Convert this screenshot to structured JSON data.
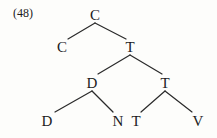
{
  "figure": {
    "example_number": "(48)",
    "kind": "syntactic-tree-diagram",
    "background_color": "#fdfdfb",
    "line_color": "#2a2a2a",
    "text_color": "#1b1b1b"
  },
  "tree": {
    "nodes": [
      {
        "id": "n0",
        "label": "C",
        "x": 95,
        "y": 8,
        "level": 0
      },
      {
        "id": "n1",
        "label": "C",
        "x": 62,
        "y": 40,
        "level": 1
      },
      {
        "id": "n2",
        "label": "T",
        "x": 130,
        "y": 40,
        "level": 1
      },
      {
        "id": "n3",
        "label": "D",
        "x": 92,
        "y": 76,
        "level": 2
      },
      {
        "id": "n4",
        "label": "T",
        "x": 165,
        "y": 76,
        "level": 2
      },
      {
        "id": "n5",
        "label": "D",
        "x": 47,
        "y": 114,
        "level": 3
      },
      {
        "id": "n6",
        "label": "N",
        "x": 118,
        "y": 114,
        "level": 3
      },
      {
        "id": "n7",
        "label": "T",
        "x": 136,
        "y": 114,
        "level": 3
      },
      {
        "id": "n8",
        "label": "V",
        "x": 198,
        "y": 114,
        "level": 3
      }
    ],
    "edges": [
      {
        "from": "n0",
        "to": "n1",
        "x1": 95,
        "y1": 23,
        "x2": 68,
        "y2": 39
      },
      {
        "from": "n0",
        "to": "n2",
        "x1": 95,
        "y1": 23,
        "x2": 126,
        "y2": 39
      },
      {
        "from": "n2",
        "to": "n3",
        "x1": 130,
        "y1": 55,
        "x2": 98,
        "y2": 74
      },
      {
        "from": "n2",
        "to": "n4",
        "x1": 130,
        "y1": 55,
        "x2": 162,
        "y2": 74
      },
      {
        "from": "n3",
        "to": "n5",
        "x1": 92,
        "y1": 91,
        "x2": 55,
        "y2": 112
      },
      {
        "from": "n3",
        "to": "n6",
        "x1": 92,
        "y1": 91,
        "x2": 113,
        "y2": 112
      },
      {
        "from": "n4",
        "to": "n7",
        "x1": 165,
        "y1": 91,
        "x2": 141,
        "y2": 112
      },
      {
        "from": "n4",
        "to": "n8",
        "x1": 165,
        "y1": 91,
        "x2": 192,
        "y2": 112
      }
    ]
  }
}
